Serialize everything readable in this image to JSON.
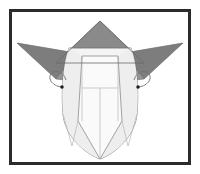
{
  "figure": {
    "style": "line-drawing",
    "caption": "",
    "label": "",
    "step_number": ""
  },
  "frame": {
    "name": "diagram-border",
    "border_color": "#2b2b2b",
    "border_width": 3,
    "fill": "#ffffff",
    "margin": 9,
    "x": 9,
    "y": 9,
    "width": 182,
    "height": 156
  },
  "palette": {
    "paper_front": "#f2f2f2",
    "paper_front_light": "#fafafa",
    "paper_front_mid": "#ececec",
    "paper_back": "#8a8a8a",
    "paper_back_dark": "#7d7d7d",
    "paper_back_light": "#969696",
    "outline": "#5a5a5a",
    "crease": "#b4b4b4",
    "eye": "#1a1a1a",
    "white": "#ffffff"
  },
  "shapes": {
    "top_horn": {
      "name": "top-horn-triangle",
      "fill": "paper_back",
      "points": "100,21 144,63 56,63"
    },
    "left_ear": {
      "name": "left-ear-triangle",
      "fill": "paper_back_dark",
      "points": "17,43 75,54 55,79"
    },
    "left_ear_under": {
      "name": "left-ear-underside",
      "fill": "paper_back_light",
      "points": "55,79 75,54 74,80"
    },
    "right_ear": {
      "name": "right-ear-triangle",
      "fill": "paper_back_dark",
      "points": "183,43 125,54 145,79"
    },
    "right_ear_under": {
      "name": "right-ear-underside",
      "fill": "paper_back_light",
      "points": "145,79 125,54 126,80"
    },
    "face_left_panel": {
      "name": "face-left-panel",
      "fill": "paper_front_mid",
      "points": "69,48 82,55 78,120 72,145 62,120 64,70"
    },
    "face_right_panel": {
      "name": "face-right-panel",
      "fill": "paper_front_mid",
      "points": "131,48 118,55 122,120 128,145 138,120 136,70"
    },
    "face_center": {
      "name": "face-center-panel",
      "fill": "paper_front_light",
      "points": "82,55 118,55 122,120 100,158 78,120"
    },
    "muzzle_left": {
      "name": "muzzle-left",
      "fill": "paper_front",
      "points": "78,120 100,120 100,158 72,145"
    },
    "muzzle_right": {
      "name": "muzzle-right",
      "fill": "paper_front",
      "points": "100,120 122,120 128,145 100,158"
    }
  },
  "creases": {
    "name": "crease-lines",
    "lines": [
      "M82,55 L82,120",
      "M118,55 L118,120",
      "M82,88 L118,88",
      "M100,88 L100,158",
      "M69,48 L64,70",
      "M131,48 L136,70"
    ]
  },
  "details": {
    "left_eye": {
      "name": "left-eye-dot",
      "cx": 62,
      "cy": 87,
      "r": 1.7,
      "fill": "eye"
    },
    "right_eye": {
      "name": "right-eye-dot",
      "cx": 138,
      "cy": 87,
      "r": 1.7,
      "fill": "eye"
    },
    "left_loop": {
      "name": "left-ear-curl",
      "path": "M62,87 C52,86 48,78 52,74 C56,70 63,73 65,79"
    },
    "right_loop": {
      "name": "right-ear-curl",
      "path": "M138,87 C148,86 152,78 148,74 C144,70 137,73 135,79"
    }
  },
  "outlines": {
    "name": "figure-outline",
    "paths": [
      "M100,21 L144,63 L56,63 Z",
      "M17,43 L75,54 L55,79 Z",
      "M183,43 L125,54 L145,79 Z",
      "M69,48 C64,62 62,90 64,112 C66,134 84,152 100,158 C116,152 134,134 136,112 C138,90 136,62 131,48",
      "M82,55 L118,55 L122,120 L100,158 L78,120 Z",
      "M72,145 L78,120 M128,145 L122,120",
      "M62,120 L72,145 M138,120 L128,145"
    ]
  }
}
